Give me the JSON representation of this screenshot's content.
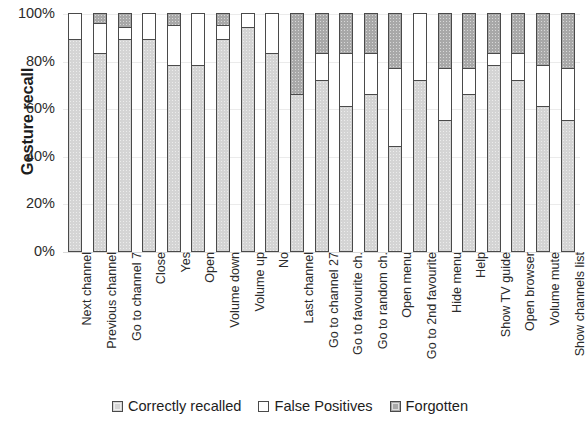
{
  "chart_data": {
    "type": "bar",
    "subtype": "stacked-bar-100",
    "title": "",
    "xlabel": "",
    "ylabel": "Gesture recall",
    "ylim": [
      0,
      100
    ],
    "ytick_labels": [
      "100%",
      "80%",
      "60%",
      "40%",
      "20%",
      "0%"
    ],
    "ytick_values": [
      100,
      80,
      60,
      40,
      20,
      0
    ],
    "grid": true,
    "legend_position": "bottom",
    "stack_order_bottom_to_top": [
      "Correctly recalled",
      "False Positives",
      "Forgotten"
    ],
    "categories": [
      "Next channel",
      "Previous channel",
      "Go to channel 7",
      "Close",
      "Yes",
      "Open",
      "Volume down",
      "Volume up",
      "No",
      "Last channel",
      "Go to channel 27",
      "Go to favourite ch.",
      "Go to random ch.",
      "Open menu",
      "Go to 2nd favourite",
      "Hide menu",
      "Help",
      "Show TV guide",
      "Open browser",
      "Volume mute",
      "Show channels list"
    ],
    "series": [
      {
        "name": "Correctly recalled",
        "color": "#d4d4d4",
        "values": [
          89,
          83,
          89,
          89,
          78,
          78,
          89,
          94,
          83,
          66,
          72,
          61,
          66,
          44,
          72,
          55,
          66,
          78,
          72,
          61,
          55
        ]
      },
      {
        "name": "False Positives",
        "color": "#ffffff",
        "values": [
          11,
          13,
          5,
          11,
          17,
          22,
          6,
          6,
          17,
          0,
          11,
          22,
          17,
          33,
          28,
          22,
          11,
          5,
          11,
          17,
          22
        ]
      },
      {
        "name": "Forgotten",
        "color": "#a8a8a8",
        "values": [
          0,
          4,
          6,
          0,
          5,
          0,
          5,
          0,
          0,
          34,
          17,
          17,
          17,
          23,
          0,
          23,
          23,
          17,
          17,
          22,
          23
        ]
      }
    ]
  },
  "legend": {
    "items": [
      {
        "label": "Correctly recalled",
        "swatch": "correct"
      },
      {
        "label": "False Positives",
        "swatch": "false"
      },
      {
        "label": "Forgotten",
        "swatch": "forgot"
      }
    ]
  },
  "axis": {
    "y_title": "Gesture recall"
  }
}
